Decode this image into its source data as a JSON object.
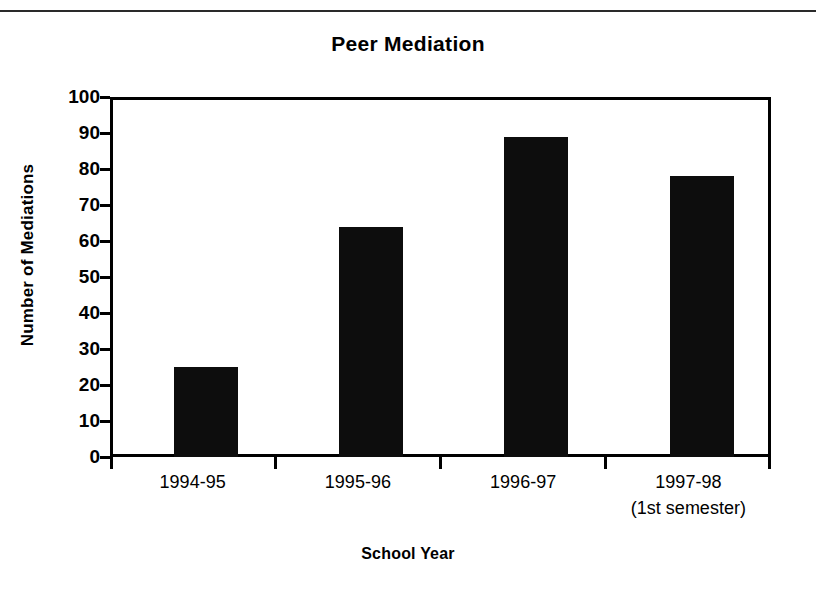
{
  "chart_data": {
    "type": "bar",
    "title": "Peer Mediation",
    "xlabel": "School Year",
    "ylabel": "Number of Mediations",
    "categories": [
      "1994-95",
      "1995-96",
      "1996-97",
      "1997-98"
    ],
    "category_sublabels": [
      "",
      "",
      "",
      "(1st semester)"
    ],
    "values": [
      25,
      64,
      89,
      78
    ],
    "ylim": [
      0,
      100
    ],
    "yticks": [
      0,
      10,
      20,
      30,
      40,
      50,
      60,
      70,
      80,
      90,
      100
    ],
    "ytick_labels": [
      "0",
      "10",
      "20",
      "30",
      "40",
      "50",
      "60",
      "70",
      "80",
      "90",
      "100"
    ],
    "grid": false,
    "legend": "none",
    "bar_color": "#0d0d0d",
    "axis_color": "#000000",
    "background": "#ffffff"
  },
  "figure": {
    "title": "Peer Mediation",
    "x_axis_title": "School Year",
    "y_axis_title": "Number of Mediations"
  }
}
